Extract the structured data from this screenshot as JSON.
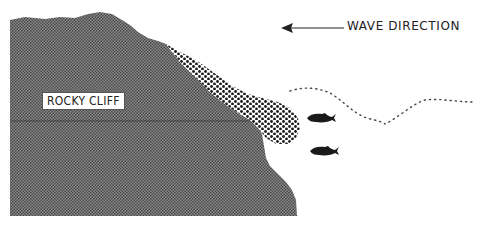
{
  "diagram": {
    "labels": {
      "cliff": "ROCKY CLIFF",
      "wave_direction": "WAVE DIRECTION"
    },
    "elements": [
      {
        "name": "rocky-cliff",
        "fill": "#7a7a7a",
        "pattern": "fine-halftone"
      },
      {
        "name": "foam-dotted-zone",
        "pattern": "coarse-dots",
        "color": "#1a1a1a"
      },
      {
        "name": "wave-dotted-line",
        "style": "dotted",
        "color": "#444444"
      },
      {
        "name": "wave-direction-arrow",
        "direction": "left"
      },
      {
        "name": "fish",
        "count": 2,
        "color": "#1a1a1a"
      }
    ]
  }
}
